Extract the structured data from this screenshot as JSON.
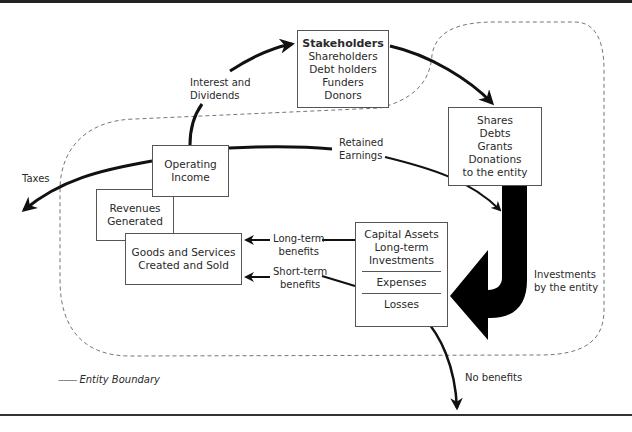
{
  "diagram": {
    "stakeholders": {
      "heading": "Stakeholders",
      "items": [
        "Shareholders",
        "Debt holders",
        "Funders",
        "Donors"
      ]
    },
    "inflows": {
      "items": [
        "Shares",
        "Debts",
        "Grants",
        "Donations",
        "to the entity"
      ]
    },
    "operating_income": [
      "Operating",
      "Income"
    ],
    "revenues": [
      "Revenues",
      "Generated"
    ],
    "goods": [
      "Goods and Services",
      "Created and Sold"
    ],
    "capital": {
      "top": [
        "Capital Assets",
        "Long-term",
        "Investments"
      ],
      "expenses": "Expenses",
      "losses": "Losses"
    },
    "labels": {
      "interest": [
        "Interest and",
        "Dividends"
      ],
      "retained": [
        "Retained",
        "Earnings"
      ],
      "taxes": "Taxes",
      "long_term": [
        "Long-term",
        "benefits"
      ],
      "short_term": [
        "Short-term",
        "benefits"
      ],
      "investments": [
        "Investments",
        "by the entity"
      ],
      "no_benefits": "No benefits"
    },
    "legend": {
      "dash": "-------",
      "text": "Entity Boundary"
    }
  }
}
